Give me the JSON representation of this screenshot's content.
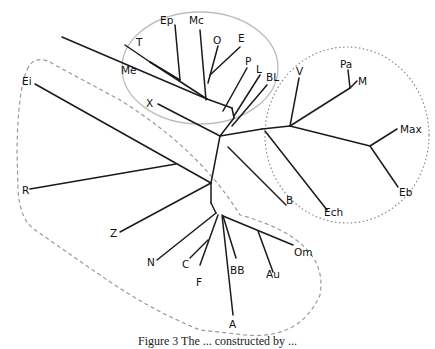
{
  "figure": {
    "type": "unrooted phylogenetic tree",
    "caption_visible_fragment": "Figure 3 The ... constructed by ..."
  },
  "groups": [
    {
      "id": "group-solid-ellipse",
      "style": "solid light grey ellipse",
      "members": [
        "T",
        "Ep",
        "Mc",
        "O",
        "E",
        "Me",
        "P",
        "L",
        "BL",
        "X"
      ]
    },
    {
      "id": "group-dotted-circle",
      "style": "dotted circle",
      "members": [
        "V",
        "Pa",
        "M",
        "Max",
        "Eb",
        "Ech"
      ]
    },
    {
      "id": "group-dashed-outline",
      "style": "dashed outline",
      "members": [
        "Ei",
        "R",
        "Z",
        "N",
        "C",
        "F",
        "BB",
        "A",
        "Au",
        "Om"
      ]
    }
  ],
  "labels": {
    "Ep": "Ep",
    "Mc": "Mc",
    "T": "T",
    "O": "O",
    "E": "E",
    "Me": "Me",
    "P": "P",
    "L": "L",
    "BL": "BL",
    "X": "X",
    "V": "V",
    "Pa": "Pa",
    "M": "M",
    "Max": "Max",
    "Eb": "Eb",
    "Ech": "Ech",
    "B": "B",
    "Ei": "Ei",
    "R": "R",
    "Z": "Z",
    "N": "N",
    "C": "C",
    "F": "F",
    "BB": "BB",
    "A": "A",
    "Au": "Au",
    "Om": "Om"
  }
}
